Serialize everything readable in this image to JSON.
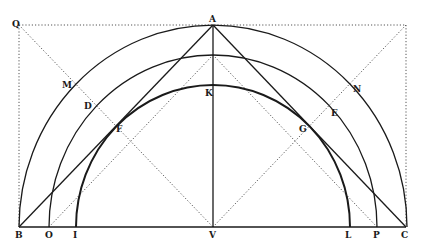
{
  "diagram": {
    "type": "geometric-construction",
    "colors": {
      "ink": "#1a1a1a",
      "dotted": "#555555",
      "background": "#ffffff"
    },
    "labels": {
      "Q": "Q",
      "A": "A",
      "M": "M",
      "N": "N",
      "D": "D",
      "E": "E",
      "K": "K",
      "F": "F",
      "G": "G",
      "B": "B",
      "O": "O",
      "I": "I",
      "V": "V",
      "L": "L",
      "P": "P",
      "C": "C"
    },
    "baseline_points": [
      "B",
      "O",
      "I",
      "V",
      "L",
      "P",
      "C"
    ],
    "arcs": [
      {
        "name": "outer-semicircle",
        "through": [
          "B",
          "M",
          "A",
          "N",
          "C"
        ]
      },
      {
        "name": "middle-semicircle",
        "through": [
          "O",
          "D",
          "E",
          "P"
        ]
      },
      {
        "name": "inner-semicircle",
        "through": [
          "I",
          "F",
          "K",
          "G",
          "L"
        ]
      }
    ],
    "solid_lines": [
      [
        "A",
        "V"
      ],
      [
        "B",
        "C"
      ],
      [
        "A",
        "B"
      ],
      [
        "A",
        "C"
      ]
    ],
    "dotted_lines": [
      [
        "Q",
        "V"
      ],
      [
        "V",
        "top-right-corner"
      ],
      [
        "Q",
        "A"
      ],
      [
        "Q",
        "B"
      ],
      [
        "top-right-corner",
        "C"
      ]
    ]
  }
}
